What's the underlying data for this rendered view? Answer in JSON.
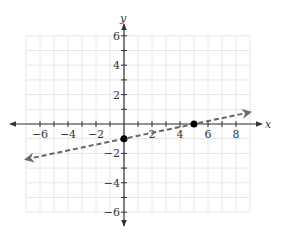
{
  "chart_data": {
    "type": "line",
    "title": "",
    "xlabel": "x",
    "ylabel": "y",
    "xlim": [
      -7,
      9
    ],
    "ylim": [
      -6,
      6
    ],
    "grid": true,
    "x_ticks": [
      -6,
      -4,
      -2,
      2,
      4,
      6,
      8
    ],
    "y_ticks": [
      6,
      4,
      2,
      -2,
      -4,
      -6
    ],
    "x_tick_labels": [
      "−6",
      "−4",
      "−2",
      "2",
      "4",
      "6",
      "8"
    ],
    "y_tick_labels": [
      "6",
      "4",
      "2",
      "−2",
      "−4",
      "−6"
    ],
    "series": [
      {
        "name": "y = x/5 − 1",
        "style": "dashed",
        "arrows": "both",
        "color": "#666666",
        "x": [
          -7,
          9
        ],
        "y": [
          -2.4,
          0.8
        ]
      }
    ],
    "points": [
      {
        "x": 0,
        "y": -1,
        "label": "y-intercept"
      },
      {
        "x": 5,
        "y": 0,
        "label": "x-intercept"
      }
    ]
  },
  "labels": {
    "x_axis": "x",
    "y_axis": "y"
  },
  "colors": {
    "grid": "#e6e6e6",
    "axis": "#333333",
    "line": "#6b6b6b",
    "point": "#000000"
  }
}
